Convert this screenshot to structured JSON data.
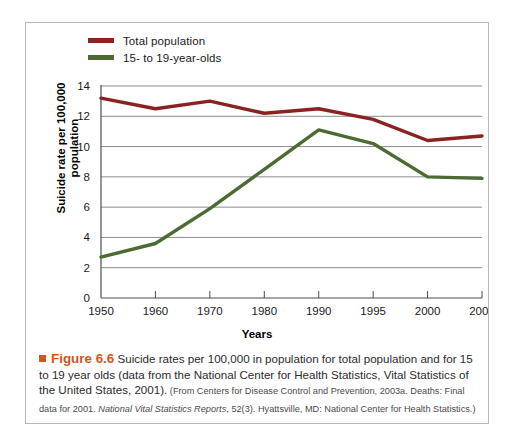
{
  "figure": {
    "bullet_icon": "orange-square-bullet",
    "number_label": "Figure 6.6",
    "caption_text": " Suicide rates per 100,000 in population for total population and for 15 to 19 year olds (data from the National Center for Health Statistics, Vital Statistics of the United States, 2001).",
    "source_part1": " (From Centers for Disease Control and Prevention, 2003a. Deaths: Final data for 2001. ",
    "source_italic": "National Vital Statistics Reports",
    "source_part2": ", 52(3). Hyattsville, MD: National Center for Health Statistics.)"
  },
  "legend": {
    "items": [
      {
        "label": "Total population",
        "color": "#8B2222"
      },
      {
        "label": "15- to 19-year-olds",
        "color": "#4C6B33"
      }
    ]
  },
  "chart_data": {
    "type": "line",
    "title": "",
    "xlabel": "Years",
    "ylabel": "Suicide rate per 100,000 population",
    "ylabel_line1": "Suicide rate per 100,000",
    "ylabel_line2": "population",
    "categories": [
      "1950",
      "1960",
      "1970",
      "1980",
      "1990",
      "1995",
      "2000",
      "2001"
    ],
    "ylim": [
      0,
      14
    ],
    "yticks": [
      0,
      2,
      4,
      6,
      8,
      10,
      12,
      14
    ],
    "ytick_labels": [
      "0",
      "2",
      "4",
      "6",
      "8",
      "10",
      "12",
      "14"
    ],
    "grid": true,
    "legend_position": "top-left",
    "series": [
      {
        "name": "Total population",
        "color": "#8B2222",
        "values": [
          13.2,
          12.5,
          13.0,
          12.2,
          12.5,
          11.8,
          10.4,
          10.7
        ]
      },
      {
        "name": "15- to 19-year-olds",
        "color": "#4C6B33",
        "values": [
          2.7,
          3.6,
          5.9,
          8.5,
          11.1,
          10.2,
          8.0,
          7.9
        ]
      }
    ]
  }
}
